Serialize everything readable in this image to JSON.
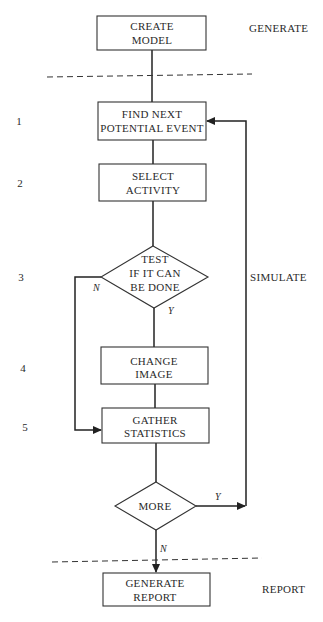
{
  "sections": {
    "generate": "GENERATE",
    "simulate": "SIMULATE",
    "report": "REPORT"
  },
  "nodes": {
    "create_model": {
      "line1": "CREATE",
      "line2": "MODEL"
    },
    "find_next": {
      "step": "1",
      "line1": "FIND NEXT",
      "line2": "POTENTIAL EVENT"
    },
    "select_activity": {
      "step": "2",
      "line1": "SELECT",
      "line2": "ACTIVITY"
    },
    "test": {
      "step": "3",
      "line1": "TEST",
      "line2": "IF IT CAN",
      "line3": "BE DONE"
    },
    "change_image": {
      "step": "4",
      "line1": "CHANGE",
      "line2": "IMAGE"
    },
    "gather_stats": {
      "step": "5",
      "line1": "GATHER",
      "line2": "STATISTICS"
    },
    "more": {
      "line1": "MORE"
    },
    "generate_report": {
      "line1": "GENERATE",
      "line2": "REPORT"
    }
  },
  "branches": {
    "test_no": "N",
    "test_yes": "Y",
    "more_yes": "Y",
    "more_no": "N"
  },
  "colors": {
    "line": "#222222",
    "text": "#2a2a2a",
    "background": "#ffffff"
  }
}
